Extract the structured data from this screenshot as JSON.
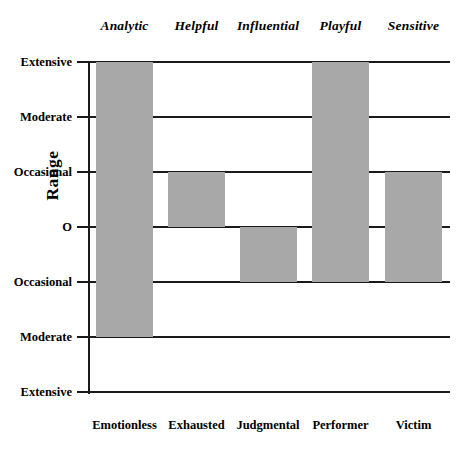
{
  "chart_data": {
    "type": "bar",
    "title": "",
    "xlabel": "",
    "ylabel": "Range",
    "grid": true,
    "legend": false,
    "orientation": "vertical-range-bars",
    "categories": [
      "Emotionless",
      "Exhausted",
      "Judgmental",
      "Performer",
      "Victim"
    ],
    "top_categories": [
      "Analytic",
      "Helpful",
      "Influential",
      "Playful",
      "Sensitive"
    ],
    "y_tick_labels": [
      "Extensive",
      "Moderate",
      "Occasional",
      "O",
      "Occasional",
      "Moderate",
      "Extensive"
    ],
    "y_tick_values": [
      3,
      2,
      1,
      0,
      -1,
      -2,
      -3
    ],
    "ylim": [
      -3,
      3
    ],
    "bars": [
      {
        "top_label": "Analytic",
        "bottom_label": "Emotionless",
        "top_value": 3,
        "bottom_value": -2,
        "top_value_label": "Extensive",
        "bottom_value_label": "Moderate"
      },
      {
        "top_label": "Helpful",
        "bottom_label": "Exhausted",
        "top_value": 1,
        "bottom_value": 0,
        "top_value_label": "Occasional",
        "bottom_value_label": "O"
      },
      {
        "top_label": "Influential",
        "bottom_label": "Judgmental",
        "top_value": 0,
        "bottom_value": -1,
        "top_value_label": "O",
        "bottom_value_label": "Occasional"
      },
      {
        "top_label": "Playful",
        "bottom_label": "Performer",
        "top_value": 3,
        "bottom_value": -1,
        "top_value_label": "Extensive",
        "bottom_value_label": "Occasional"
      },
      {
        "top_label": "Sensitive",
        "bottom_label": "Victim",
        "top_value": 1,
        "bottom_value": -1,
        "top_value_label": "Occasional",
        "bottom_value_label": "Occasional"
      }
    ],
    "colors": {
      "bar_fill": "#a8a8a8",
      "axis": "#1a1a1a",
      "background": "#ffffff",
      "text": "#000000"
    }
  }
}
